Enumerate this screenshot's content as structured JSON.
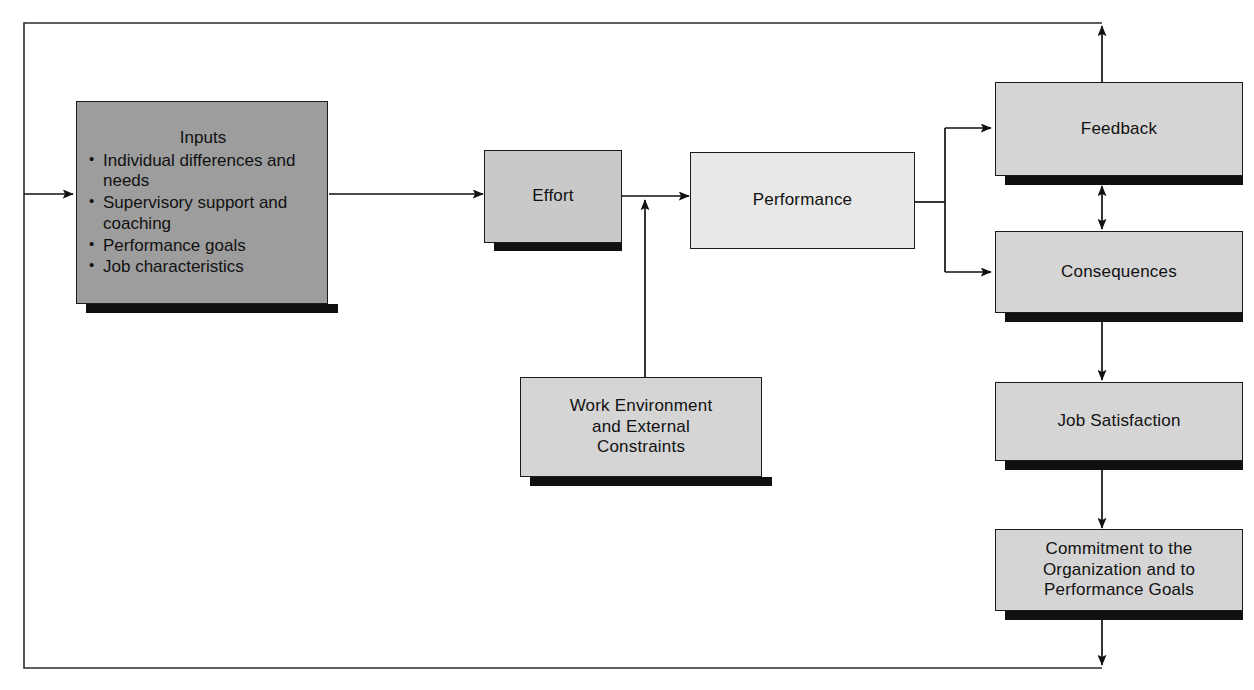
{
  "diagram": {
    "outer_loop": {
      "name": "feedback-loop",
      "description": "Outer feedback loop from Commitment back to Inputs"
    },
    "colors": {
      "inputs_fill": "#9d9d9d",
      "effort_fill": "#c9c9c9",
      "performance_fill": "#e8e8e8",
      "standard_fill": "#d5d5d5",
      "border": "#1a1a1a",
      "shadow": "#101010",
      "background": "#ffffff"
    },
    "nodes": {
      "inputs": {
        "id": "inputs",
        "title": "Inputs",
        "bullets": [
          "Individual differences and needs",
          "Supervisory support and coaching",
          "Performance goals",
          "Job characteristics"
        ]
      },
      "effort": {
        "id": "effort",
        "label": "Effort"
      },
      "performance": {
        "id": "performance",
        "label": "Performance"
      },
      "work_environment": {
        "id": "work-environment",
        "label": "Work Environment and External Constraints",
        "lines": [
          "Work Environment",
          "and External",
          "Constraints"
        ]
      },
      "feedback": {
        "id": "feedback",
        "label": "Feedback"
      },
      "consequences": {
        "id": "consequences",
        "label": "Consequences"
      },
      "job_satisfaction": {
        "id": "job-satisfaction",
        "label": "Job Satisfaction"
      },
      "commitment": {
        "id": "commitment",
        "label": "Commitment to the Organization and to Performance Goals",
        "lines": [
          "Commitment to the",
          "Organization and to",
          "Performance Goals"
        ]
      }
    },
    "connections": [
      {
        "name": "loop-into-inputs",
        "from": "feedback-loop",
        "to": "inputs",
        "type": "arrow"
      },
      {
        "name": "inputs-to-effort",
        "from": "inputs",
        "to": "effort",
        "type": "arrow"
      },
      {
        "name": "effort-to-performance",
        "from": "effort",
        "to": "performance",
        "type": "arrow"
      },
      {
        "name": "work-environment-to-effort-performance",
        "from": "work-environment",
        "to": "performance",
        "type": "arrow"
      },
      {
        "name": "performance-to-feedback",
        "from": "performance",
        "to": "feedback",
        "type": "arrow"
      },
      {
        "name": "performance-to-consequences",
        "from": "performance",
        "to": "consequences",
        "type": "arrow"
      },
      {
        "name": "feedback-consequences-bidirectional",
        "from": "consequences",
        "to": "feedback",
        "type": "double-arrow"
      },
      {
        "name": "feedback-to-loop-top",
        "from": "feedback",
        "to": "feedback-loop",
        "type": "arrow"
      },
      {
        "name": "consequences-to-job-satisfaction",
        "from": "consequences",
        "to": "job-satisfaction",
        "type": "arrow"
      },
      {
        "name": "job-satisfaction-to-commitment",
        "from": "job-satisfaction",
        "to": "commitment",
        "type": "arrow"
      },
      {
        "name": "commitment-to-loop-bottom",
        "from": "commitment",
        "to": "feedback-loop",
        "type": "arrow"
      }
    ]
  }
}
